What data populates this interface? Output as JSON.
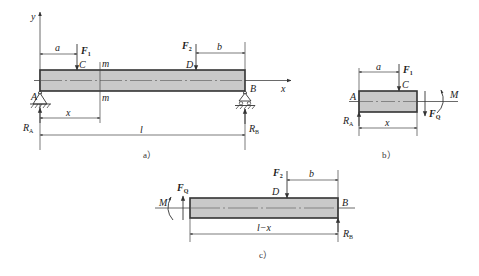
{
  "figure": {
    "panels": [
      {
        "id": "a",
        "caption": "a）",
        "labels": {
          "y_axis": "y",
          "x_axis": "x",
          "point_A": "A",
          "point_B": "B",
          "point_C": "C",
          "point_D": "D",
          "section_top": "m",
          "section_bottom": "m",
          "dim_a": "a",
          "dim_b": "b",
          "dim_x": "x",
          "dim_l": "l",
          "force1": "F",
          "force1_sub": "1",
          "force2": "F",
          "force2_sub": "2",
          "reactionA": "R",
          "reactionA_sub": "A",
          "reactionB": "R",
          "reactionB_sub": "B"
        }
      },
      {
        "id": "b",
        "caption": "b）",
        "labels": {
          "point_A": "A",
          "point_C": "C",
          "dim_a": "a",
          "dim_x": "x",
          "force1": "F",
          "force1_sub": "1",
          "shear": "F",
          "shear_sub": "Q",
          "moment": "M",
          "reactionA": "R",
          "reactionA_sub": "A"
        }
      },
      {
        "id": "c",
        "caption": "c）",
        "labels": {
          "point_B": "B",
          "point_D": "D",
          "dim_b": "b",
          "dim_lx": "l−x",
          "force2": "F",
          "force2_sub": "2",
          "shear": "F",
          "shear_sub": "Q",
          "moment": "M",
          "reactionB": "R",
          "reactionB_sub": "B"
        }
      }
    ],
    "colors": {
      "beam_fill": "#c9c9c9",
      "line": "#333333",
      "background": "#ffffff"
    }
  }
}
